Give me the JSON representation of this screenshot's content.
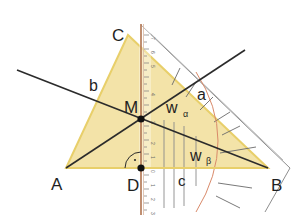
{
  "diagram": {
    "colors": {
      "triangle_fill": "#f3e3a8",
      "triangle_edge": "#e8cf6a",
      "line": "#2b2b2b",
      "ruler_edge": "#b0734f",
      "set_square": "#8a8a8a",
      "arc": "#d98a6a",
      "point": "#111111"
    },
    "vertices": {
      "A": {
        "label": "A",
        "x": 66,
        "y": 168
      },
      "B": {
        "label": "B",
        "x": 268,
        "y": 168
      },
      "C": {
        "label": "C",
        "x": 128,
        "y": 35
      }
    },
    "points": {
      "M": {
        "label": "M",
        "x": 141,
        "y": 119
      },
      "D": {
        "label": "D",
        "x": 141,
        "y": 168
      }
    },
    "side_labels": {
      "a": "a",
      "b": "b",
      "c": "c"
    },
    "bisector_labels": {
      "w_alpha": {
        "main": "w",
        "sub": "α"
      },
      "w_beta": {
        "main": "w",
        "sub": "β"
      }
    },
    "right_angle_marker": "·",
    "ruler_ticks": [
      "7",
      "6",
      "5",
      "4",
      "3",
      "2",
      "1",
      "0",
      "1",
      "2",
      "3"
    ]
  }
}
